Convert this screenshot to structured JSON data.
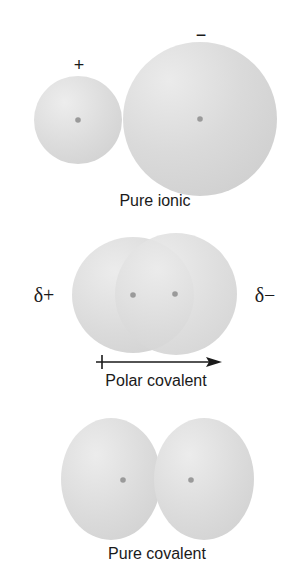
{
  "figure": {
    "colors": {
      "background": "#ffffff",
      "cloud_fill": "#d9d9d9",
      "cloud_highlight": "#ececec",
      "nucleus": "#9a9a9a",
      "text": "#1a1a1a"
    },
    "panels": [
      {
        "id": "pure-ionic",
        "caption": "Pure ionic",
        "charges": {
          "left": "+",
          "right": "−"
        }
      },
      {
        "id": "polar-covalent",
        "caption": "Polar covalent",
        "charges": {
          "left": "δ+",
          "right": "δ−"
        },
        "dipole_arrow": "left-to-right"
      },
      {
        "id": "pure-covalent",
        "caption": "Pure covalent"
      }
    ]
  }
}
